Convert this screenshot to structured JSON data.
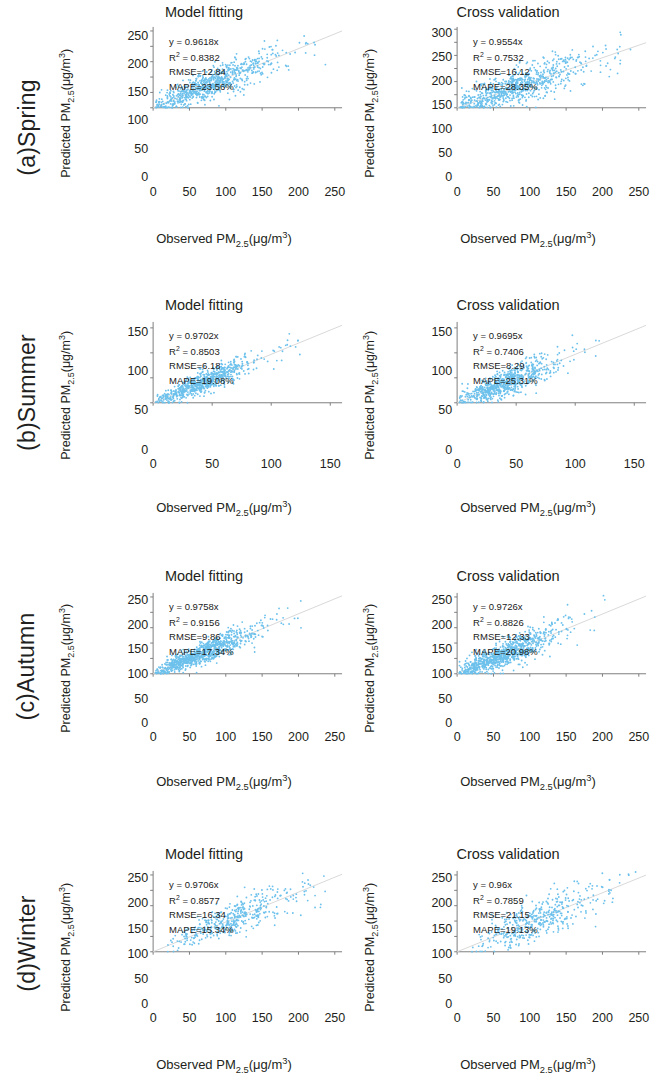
{
  "figure": {
    "axis_titles": {
      "x_prefix": "Observed PM",
      "x_sub": "2.5",
      "x_unit": "(μg/m",
      "x_sup": "3",
      "x_suffix": ")",
      "y_prefix": "Predicted PM",
      "y_sub": "2.5",
      "y_unit": "(μg/m",
      "y_sup": "3",
      "y_suffix": ")"
    },
    "column_titles": [
      "Model fitting",
      "Cross validation"
    ],
    "point_color": "#6cc1ec",
    "fit_line_color": "#d9d9d9",
    "axis_color": "#7f7f7f"
  },
  "rows": [
    {
      "label": "(a)Spring"
    },
    {
      "label": "(b)Summer"
    },
    {
      "label": "(c)Autumn"
    },
    {
      "label": "(d)Winter"
    }
  ],
  "chart_data": [
    {
      "type": "scatter",
      "panel_id": "spring-model-fitting",
      "season": "(a)Spring",
      "title": "Model fitting",
      "xlabel": "Observed PM2.5(μg/m3)",
      "ylabel": "Predicted PM2.5(μg/m3)",
      "xlim": [
        0,
        260
      ],
      "ylim": [
        0,
        260
      ],
      "xticks": [
        0,
        50,
        100,
        150,
        200,
        250
      ],
      "yticks": [
        0,
        50,
        100,
        150,
        200,
        250
      ],
      "grid": false,
      "n_points": 760,
      "annotations": {
        "equation": "y = 0.9618x",
        "r2_label": "R",
        "r2_sup": "2",
        "r2_value": " = 0.8382",
        "rmse": "RMSE=12.84",
        "mape": "MAPE=23.56%"
      },
      "stats": {
        "slope": 0.9618,
        "r2": 0.8382,
        "rmse": 12.84,
        "mape": 23.56
      },
      "scatter_model": {
        "x_mean": 72,
        "x_spread": 46,
        "x_min": 3,
        "x_max": 248,
        "noise": 17,
        "seed": 11
      }
    },
    {
      "type": "scatter",
      "panel_id": "spring-cross-validation",
      "season": "(a)Spring",
      "title": "Cross validation",
      "xlabel": "Observed PM2.5(μg/m3)",
      "ylabel": "Predicted PM2.5(μg/m3)",
      "xlim": [
        0,
        260
      ],
      "ylim": [
        0,
        305
      ],
      "xticks": [
        0,
        50,
        100,
        150,
        200,
        250
      ],
      "yticks": [
        0,
        50,
        100,
        150,
        200,
        250,
        300
      ],
      "grid": false,
      "n_points": 760,
      "annotations": {
        "equation": "y = 0.9554x",
        "r2_label": "R",
        "r2_sup": "2",
        "r2_value": " = 0.7532",
        "rmse": "RMSE=16.12",
        "mape": "MAPE=28.35%"
      },
      "stats": {
        "slope": 0.9554,
        "r2": 0.7532,
        "rmse": 16.12,
        "mape": 28.35
      },
      "scatter_model": {
        "x_mean": 72,
        "x_spread": 46,
        "x_min": 3,
        "x_max": 248,
        "noise": 24,
        "seed": 23
      }
    },
    {
      "type": "scatter",
      "panel_id": "summer-model-fitting",
      "season": "(b)Summer",
      "title": "Model fitting",
      "xlabel": "Observed PM2.5(μg/m3)",
      "ylabel": "Predicted PM2.5(μg/m3)",
      "xlim": [
        0,
        160
      ],
      "ylim": [
        0,
        160
      ],
      "xticks": [
        0,
        50,
        100,
        150
      ],
      "yticks": [
        0,
        50,
        100,
        150
      ],
      "grid": false,
      "n_points": 700,
      "annotations": {
        "equation": "y = 0.9702x",
        "r2_label": "R",
        "r2_sup": "2",
        "r2_value": " = 0.8503",
        "rmse": "RMSE=6.18",
        "mape": "MAPE=19.08%"
      },
      "stats": {
        "slope": 0.9702,
        "r2": 0.8503,
        "rmse": 6.18,
        "mape": 19.08
      },
      "scatter_model": {
        "x_mean": 38,
        "x_spread": 20,
        "x_min": 2,
        "x_max": 130,
        "noise": 7,
        "seed": 31
      }
    },
    {
      "type": "scatter",
      "panel_id": "summer-cross-validation",
      "season": "(b)Summer",
      "title": "Cross validation",
      "xlabel": "Observed PM2.5(μg/m3)",
      "ylabel": "Predicted PM2.5(μg/m3)",
      "xlim": [
        0,
        160
      ],
      "ylim": [
        0,
        160
      ],
      "xticks": [
        0,
        50,
        100,
        150
      ],
      "yticks": [
        0,
        50,
        100,
        150
      ],
      "grid": false,
      "n_points": 700,
      "annotations": {
        "equation": "y = 0.9695x",
        "r2_label": "R",
        "r2_sup": "2",
        "r2_value": " = 0.7406",
        "rmse": "RMSE=8.29",
        "mape": "MAPE=25.31%"
      },
      "stats": {
        "slope": 0.9695,
        "r2": 0.7406,
        "rmse": 8.29,
        "mape": 25.31
      },
      "scatter_model": {
        "x_mean": 38,
        "x_spread": 20,
        "x_min": 2,
        "x_max": 130,
        "noise": 10,
        "seed": 47
      }
    },
    {
      "type": "scatter",
      "panel_id": "autumn-model-fitting",
      "season": "(c)Autumn",
      "title": "Model fitting",
      "xlabel": "Observed PM2.5(μg/m3)",
      "ylabel": "Predicted PM2.5(μg/m3)",
      "xlim": [
        0,
        260
      ],
      "ylim": [
        0,
        260
      ],
      "xticks": [
        0,
        50,
        100,
        150,
        200,
        250
      ],
      "yticks": [
        0,
        50,
        100,
        150,
        200,
        250
      ],
      "grid": false,
      "n_points": 900,
      "annotations": {
        "equation": "y = 0.9758x",
        "r2_label": "R",
        "r2_sup": "2",
        "r2_value": " = 0.9156",
        "rmse": "RMSE=9.86",
        "mape": "MAPE=17.34%"
      },
      "stats": {
        "slope": 0.9758,
        "r2": 0.9156,
        "rmse": 9.86,
        "mape": 17.34
      },
      "scatter_model": {
        "x_mean": 62,
        "x_spread": 34,
        "x_min": 3,
        "x_max": 210,
        "noise": 11,
        "seed": 59
      }
    },
    {
      "type": "scatter",
      "panel_id": "autumn-cross-validation",
      "season": "(c)Autumn",
      "title": "Cross validation",
      "xlabel": "Observed PM2.5(μg/m3)",
      "ylabel": "Predicted PM2.5(μg/m3)",
      "xlim": [
        0,
        260
      ],
      "ylim": [
        0,
        260
      ],
      "xticks": [
        0,
        50,
        100,
        150,
        200,
        250
      ],
      "yticks": [
        0,
        50,
        100,
        150,
        200,
        250
      ],
      "grid": false,
      "n_points": 900,
      "annotations": {
        "equation": "y = 0.9726x",
        "r2_label": "R",
        "r2_sup": "2",
        "r2_value": " = 0.8826",
        "rmse": "RMSE=12.33",
        "mape": "MAPE=20.98%"
      },
      "stats": {
        "slope": 0.9726,
        "r2": 0.8826,
        "rmse": 12.33,
        "mape": 20.98
      },
      "scatter_model": {
        "x_mean": 62,
        "x_spread": 34,
        "x_min": 3,
        "x_max": 210,
        "noise": 15,
        "seed": 71
      }
    },
    {
      "type": "scatter",
      "panel_id": "winter-model-fitting",
      "season": "(d)Winter",
      "title": "Model fitting",
      "xlabel": "Observed PM2.5(μg/m3)",
      "ylabel": "Predicted PM2.5(μg/m3)",
      "xlim": [
        0,
        260
      ],
      "ylim": [
        0,
        260
      ],
      "xticks": [
        0,
        50,
        100,
        150,
        200,
        250
      ],
      "yticks": [
        0,
        50,
        100,
        150,
        200,
        250
      ],
      "grid": false,
      "n_points": 430,
      "annotations": {
        "equation": "y = 0.9706x",
        "r2_label": "R",
        "r2_sup": "2",
        "r2_value": " = 0.8577",
        "rmse": "RMSE=16.34",
        "mape": "MAPE=15.34%"
      },
      "stats": {
        "slope": 0.9706,
        "r2": 0.8577,
        "rmse": 16.34,
        "mape": 15.34
      },
      "scatter_model": {
        "x_mean": 105,
        "x_spread": 45,
        "x_min": 20,
        "x_max": 250,
        "noise": 17,
        "seed": 83
      }
    },
    {
      "type": "scatter",
      "panel_id": "winter-cross-validation",
      "season": "(d)Winter",
      "title": "Cross validation",
      "xlabel": "Observed PM2.5(μg/m3)",
      "ylabel": "Predicted PM2.5(μg/m3)",
      "xlim": [
        0,
        260
      ],
      "ylim": [
        0,
        260
      ],
      "xticks": [
        0,
        50,
        100,
        150,
        200,
        250
      ],
      "yticks": [
        0,
        50,
        100,
        150,
        200,
        250
      ],
      "grid": false,
      "n_points": 430,
      "annotations": {
        "equation": "y = 0.96x",
        "r2_label": "R",
        "r2_sup": "2",
        "r2_value": " = 0.7859",
        "rmse": "RMSE=21.15",
        "mape": "MAPE=19.13%"
      },
      "stats": {
        "slope": 0.96,
        "r2": 0.7859,
        "rmse": 21.15,
        "mape": 19.13
      },
      "scatter_model": {
        "x_mean": 105,
        "x_spread": 45,
        "x_min": 20,
        "x_max": 250,
        "noise": 23,
        "seed": 97
      }
    }
  ]
}
